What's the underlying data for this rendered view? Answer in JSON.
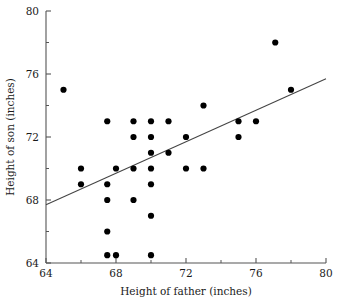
{
  "chart_data": {
    "type": "scatter",
    "title": "",
    "xlabel": "Height of father (inches)",
    "ylabel": "Height of son (inches)",
    "xlim": [
      64,
      80
    ],
    "ylim": [
      64,
      80
    ],
    "xticks": [
      64,
      68,
      72,
      76,
      80
    ],
    "yticks": [
      64,
      68,
      72,
      76,
      80
    ],
    "xtick_labels": [
      "64",
      "68",
      "72",
      "76",
      "80"
    ],
    "ytick_labels": [
      "64",
      "68",
      "72",
      "76",
      "80"
    ],
    "xminor_ticks": [
      66,
      70,
      74,
      78
    ],
    "yminor_ticks": [
      66,
      70,
      74,
      78
    ],
    "grid": false,
    "legend": null,
    "marker": "filled-circle",
    "marker_color": "#000000",
    "marker_size": 3.1,
    "points": [
      {
        "x": 65.0,
        "y": 75.0
      },
      {
        "x": 66.0,
        "y": 70.0
      },
      {
        "x": 66.0,
        "y": 69.0
      },
      {
        "x": 67.5,
        "y": 73.0
      },
      {
        "x": 67.5,
        "y": 69.0
      },
      {
        "x": 67.5,
        "y": 68.0
      },
      {
        "x": 67.5,
        "y": 66.0
      },
      {
        "x": 67.5,
        "y": 64.5
      },
      {
        "x": 68.0,
        "y": 70.0
      },
      {
        "x": 68.0,
        "y": 64.5
      },
      {
        "x": 69.0,
        "y": 73.0
      },
      {
        "x": 69.0,
        "y": 72.0
      },
      {
        "x": 69.0,
        "y": 70.0
      },
      {
        "x": 69.0,
        "y": 68.0
      },
      {
        "x": 70.0,
        "y": 73.0
      },
      {
        "x": 70.0,
        "y": 72.0
      },
      {
        "x": 70.0,
        "y": 71.0
      },
      {
        "x": 70.0,
        "y": 70.0
      },
      {
        "x": 70.0,
        "y": 69.0
      },
      {
        "x": 70.0,
        "y": 67.0
      },
      {
        "x": 70.0,
        "y": 64.5
      },
      {
        "x": 71.0,
        "y": 73.0
      },
      {
        "x": 71.0,
        "y": 71.0
      },
      {
        "x": 72.0,
        "y": 72.0
      },
      {
        "x": 72.0,
        "y": 70.0
      },
      {
        "x": 73.0,
        "y": 74.0
      },
      {
        "x": 73.0,
        "y": 70.0
      },
      {
        "x": 75.0,
        "y": 73.0
      },
      {
        "x": 75.0,
        "y": 72.0
      },
      {
        "x": 76.0,
        "y": 73.0
      },
      {
        "x": 77.1,
        "y": 78.0
      },
      {
        "x": 78.0,
        "y": 75.0
      }
    ],
    "fit_line": {
      "x0": 64.0,
      "y0": 67.7,
      "x1": 80.0,
      "y1": 75.7,
      "color": "#444444"
    }
  }
}
